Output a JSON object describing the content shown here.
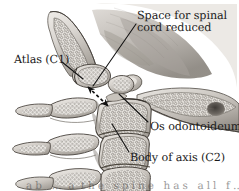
{
  "figure": {
    "background_color": "#ffffff",
    "ink_color": "#1a1a1a",
    "bone_fill": "#d8d4cf",
    "bone_shadow": "#8d8881",
    "soft_tissue": "#b9b4ae"
  },
  "labels": {
    "space_for_spinal_cord": "Space for spinal\ncord reduced",
    "atlas": "Atlas (C1)",
    "os_odontoideum": "Os odontoideum",
    "body_of_axis": "Body of axis (C2)",
    "caption_partial": "a b   …  a  t h e   s p i n e   h a s   a l l   f …"
  },
  "annotations": {
    "double_arrow": {
      "name": "reduced-space-double-arrow",
      "style": "dashed double-headed",
      "from": [
        86,
        86
      ],
      "to": [
        110,
        108
      ]
    },
    "leaders": [
      {
        "name": "leader-space-for-spinal-cord",
        "from": [
          135,
          24
        ],
        "to": [
          93,
          88
        ]
      },
      {
        "name": "leader-atlas",
        "from": [
          62,
          62
        ],
        "to": [
          82,
          78
        ]
      },
      {
        "name": "leader-os-odontoideum",
        "from": [
          148,
          123
        ],
        "to": [
          118,
          95
        ]
      },
      {
        "name": "leader-body-of-axis",
        "from": [
          128,
          152
        ],
        "to": [
          112,
          123
        ]
      }
    ]
  },
  "structures": [
    {
      "name": "occiput-clivus",
      "label": "Occiput / clivus"
    },
    {
      "name": "atlas-c1-anterior-arch",
      "label": "Atlas (C1) anterior arch"
    },
    {
      "name": "os-odontoideum-ossicle",
      "label": "Os odontoideum"
    },
    {
      "name": "axis-c2-body",
      "label": "Body of axis (C2)"
    },
    {
      "name": "c3-vertebral-body",
      "label": "C3 vertebral body"
    },
    {
      "name": "c4-vertebral-body",
      "label": "C4 vertebral body"
    },
    {
      "name": "spinous-processes",
      "label": "Spinous processes"
    },
    {
      "name": "occipital-bone-posterior",
      "label": "Posterior occipital bone"
    }
  ]
}
